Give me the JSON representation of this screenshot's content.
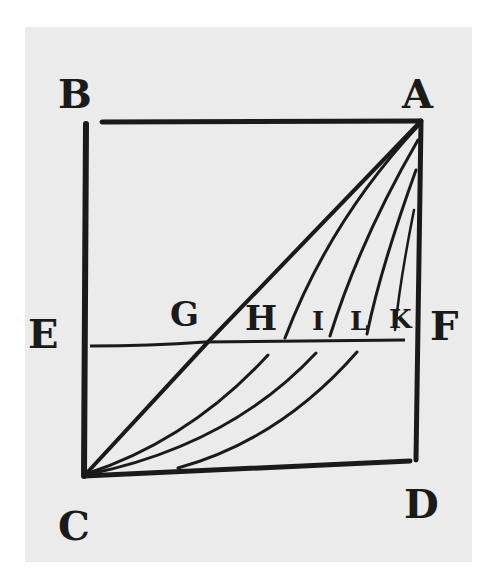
{
  "figure": {
    "colors": {
      "paper": "#ebebeb",
      "ink": "#1a1a1a",
      "background": "#ffffff"
    },
    "labels": {
      "A": "A",
      "B": "B",
      "C": "C",
      "D": "D",
      "E": "E",
      "F": "F",
      "G": "G",
      "H": "H",
      "I": "I",
      "L": "L",
      "K": "K"
    },
    "points": {
      "A": [
        421,
        121
      ],
      "B": [
        85,
        122
      ],
      "C": [
        83,
        476
      ],
      "D": [
        415,
        461
      ],
      "E": [
        85,
        346
      ],
      "F": [
        415,
        340
      ]
    },
    "lines": [
      {
        "name": "AB",
        "from": "A",
        "to": "B"
      },
      {
        "name": "BC",
        "from": "B",
        "to": "C"
      },
      {
        "name": "CD",
        "from": "C",
        "to": "D"
      },
      {
        "name": "DA",
        "from": "D",
        "to": "A"
      },
      {
        "name": "EF",
        "from": "E",
        "to": "F"
      },
      {
        "name": "AC-diagonal",
        "from": "A",
        "to": "C",
        "through": "G"
      }
    ],
    "curves": [
      {
        "name": "curve-AHC",
        "through": "H"
      },
      {
        "name": "curve-AIC",
        "through": "I"
      },
      {
        "name": "curve-ALC",
        "through": "L"
      },
      {
        "name": "curve-AKC",
        "through": "K"
      }
    ]
  }
}
